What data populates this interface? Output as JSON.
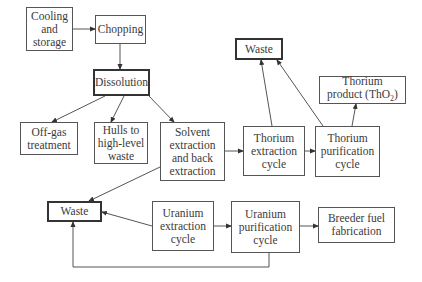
{
  "diagram": {
    "nodes": {
      "cooling": {
        "label": "Cooling\nand\nstorage"
      },
      "chopping": {
        "label": "Chopping"
      },
      "dissolution": {
        "label": "Dissolution"
      },
      "offgas": {
        "label": "Off-gas\ntreatment"
      },
      "hulls": {
        "label": "Hulls to\nhigh-level\nwaste"
      },
      "solvent": {
        "label": "Solvent\nextraction\nand back\nextraction"
      },
      "waste_top": {
        "label": "Waste"
      },
      "thorium_product": {
        "label_main": "Thorium\nproduct (ThO",
        "label_sub": "2",
        "label_end": ")"
      },
      "thorium_extraction": {
        "label": "Thorium\nextraction\ncycle"
      },
      "thorium_purification": {
        "label": "Thorium\npurification\ncycle"
      },
      "waste_bottom": {
        "label": "Waste"
      },
      "uranium_extraction": {
        "label": "Uranium\nextraction\ncycle"
      },
      "uranium_purification": {
        "label": "Uranium\npurification\ncycle"
      },
      "breeder": {
        "label": "Breeder fuel\nfabrication"
      }
    },
    "edges": [
      {
        "from": "cooling",
        "to": "chopping"
      },
      {
        "from": "chopping",
        "to": "dissolution"
      },
      {
        "from": "dissolution",
        "to": "offgas"
      },
      {
        "from": "dissolution",
        "to": "hulls"
      },
      {
        "from": "dissolution",
        "to": "solvent"
      },
      {
        "from": "solvent",
        "to": "thorium_extraction"
      },
      {
        "from": "solvent",
        "to": "waste_bottom"
      },
      {
        "from": "thorium_extraction",
        "to": "thorium_purification"
      },
      {
        "from": "thorium_extraction",
        "to": "waste_top"
      },
      {
        "from": "thorium_purification",
        "to": "waste_top"
      },
      {
        "from": "thorium_purification",
        "to": "thorium_product"
      },
      {
        "from": "uranium_extraction",
        "to": "waste_bottom"
      },
      {
        "from": "uranium_extraction",
        "to": "uranium_purification"
      },
      {
        "from": "uranium_purification",
        "to": "breeder"
      },
      {
        "from": "uranium_purification",
        "to": "waste_bottom"
      }
    ]
  }
}
